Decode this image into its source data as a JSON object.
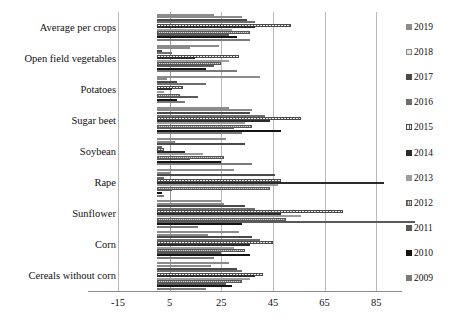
{
  "chart_data": {
    "type": "bar",
    "orientation": "horizontal",
    "title": "",
    "subtitle": "",
    "xlabel": "",
    "ylabel": "",
    "xlim": [
      -15,
      95
    ],
    "xticks": [
      -15,
      5,
      25,
      45,
      65,
      85
    ],
    "xtick_labels": [
      "-15",
      "5",
      "25",
      "45",
      "65",
      "85"
    ],
    "grid": true,
    "legend_position": "right",
    "categories": [
      "Average per crops",
      "Open field vegetables",
      "Potatoes",
      "Sugar beet",
      "Soybean",
      "Rape",
      "Sunflower",
      "Corn",
      "Cereals without corn"
    ],
    "series": [
      {
        "name": "2019",
        "color": "#8c8c8c",
        "pattern": "solid",
        "values": [
          22,
          24,
          40,
          28,
          27,
          30,
          25,
          32,
          28
        ]
      },
      {
        "name": "2018",
        "color": "#e8e8e8",
        "pattern": "solid",
        "values": [
          33,
          13,
          4,
          37,
          7,
          5,
          26,
          20,
          21
        ]
      },
      {
        "name": "2017",
        "color": "#4a4a4a",
        "pattern": "solid",
        "values": [
          35,
          2,
          8,
          36,
          34,
          46,
          34,
          37,
          31
        ]
      },
      {
        "name": "2016",
        "color": "#6e6e6e",
        "pattern": "solid",
        "values": [
          38,
          6,
          19,
          42,
          2,
          3,
          38,
          40,
          33
        ]
      },
      {
        "name": "2015",
        "color": "#f2f2f2",
        "pattern": "dashed",
        "values": [
          52,
          32,
          10,
          56,
          3,
          48,
          72,
          45,
          41
        ]
      },
      {
        "name": "2014",
        "color": "#2b2b2b",
        "pattern": "solid",
        "values": [
          38,
          15,
          6,
          44,
          11,
          88,
          48,
          36,
          38
        ]
      },
      {
        "name": "2013",
        "color": "#9d9d9d",
        "pattern": "solid",
        "values": [
          29,
          28,
          3,
          34,
          18,
          47,
          56,
          30,
          36
        ]
      },
      {
        "name": "2012",
        "color": "#7d7d7d",
        "pattern": "hatched",
        "values": [
          36,
          25,
          9,
          37,
          26,
          44,
          50,
          34,
          33
        ]
      },
      {
        "name": "2011",
        "color": "#5a5a5a",
        "pattern": "solid",
        "values": [
          28,
          22,
          16,
          30,
          13,
          6,
          100,
          25,
          27
        ]
      },
      {
        "name": "2010",
        "color": "#141414",
        "pattern": "solid",
        "values": [
          31,
          19,
          8,
          48,
          25,
          2,
          33,
          36,
          29
        ]
      },
      {
        "name": "2009",
        "color": "#7a7a7a",
        "pattern": "solid",
        "values": [
          36,
          31,
          11,
          33,
          37,
          3,
          16,
          22,
          19
        ]
      }
    ]
  }
}
